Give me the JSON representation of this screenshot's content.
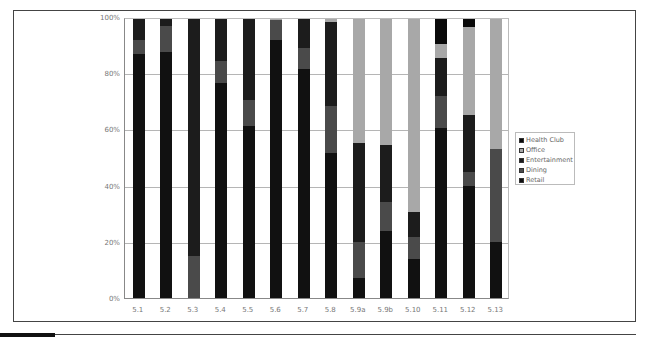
{
  "chart_data": {
    "type": "bar",
    "stacked": true,
    "percent": true,
    "title": "",
    "xlabel": "",
    "ylabel": "",
    "ylim": [
      0,
      100
    ],
    "yticks": [
      "0%",
      "20%",
      "40%",
      "60%",
      "80%",
      "100%"
    ],
    "grid": true,
    "legend_position": "right",
    "categories": [
      "5.1",
      "5.2",
      "5.3",
      "5.4",
      "5.5",
      "5.6",
      "5.7",
      "5.8",
      "5.9a",
      "5.9b",
      "5.10",
      "5.11",
      "5.12",
      "5.13"
    ],
    "series": [
      {
        "name": "Retail",
        "color": "#111111",
        "values": [
          87.5,
          88,
          0,
          77,
          61.5,
          92.5,
          82,
          52,
          7,
          24,
          14,
          61,
          40,
          20
        ]
      },
      {
        "name": "Dining",
        "color": "#4a4a4a",
        "values": [
          5,
          9.5,
          15,
          8,
          9.5,
          7,
          7.5,
          17,
          13,
          10.5,
          8,
          11.5,
          5,
          33.5
        ]
      },
      {
        "name": "Entertainment",
        "color": "#1c1c1c",
        "values": [
          7.5,
          2.5,
          85,
          15,
          29,
          0,
          10.5,
          30,
          35.5,
          20.5,
          9,
          13.5,
          20.5,
          0
        ]
      },
      {
        "name": "Office",
        "color": "#a8a8a8",
        "values": [
          0,
          0,
          0,
          0,
          0,
          0.5,
          0,
          1,
          44.5,
          45,
          69,
          5,
          31.5,
          46.5
        ]
      },
      {
        "name": "Health Club",
        "color": "#0a0a0a",
        "values": [
          0,
          0,
          0,
          0,
          0,
          0,
          0,
          0,
          0,
          0,
          0,
          9,
          3,
          0
        ]
      }
    ]
  },
  "legend": {
    "items": [
      {
        "label": "Health Club",
        "color": "#0a0a0a"
      },
      {
        "label": "Office",
        "color": "#a8a8a8"
      },
      {
        "label": "Entertainment",
        "color": "#1c1c1c"
      },
      {
        "label": "Dining",
        "color": "#4a4a4a"
      },
      {
        "label": "Retail",
        "color": "#111111"
      }
    ]
  }
}
